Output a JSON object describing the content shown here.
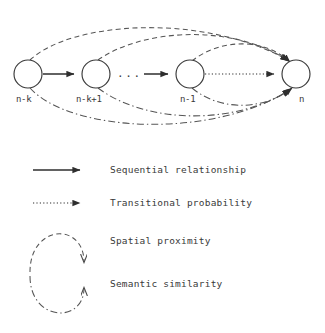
{
  "diagram": {
    "nodes": [
      {
        "id": "n-k",
        "label": "n-k",
        "cx": 28,
        "cy": 74,
        "r": 14
      },
      {
        "id": "n-k+1",
        "label": "n-k+1",
        "cx": 96,
        "cy": 74,
        "r": 14
      },
      {
        "id": "n-1",
        "label": "n-1",
        "cx": 190,
        "cy": 74,
        "r": 14
      },
      {
        "id": "n",
        "label": "n",
        "cx": 296,
        "cy": 74,
        "r": 14
      }
    ],
    "ellipsis": "...",
    "edge_types": {
      "sequential": "solid",
      "transitional": "dotted",
      "spatial": "dashed",
      "semantic": "dashdot"
    },
    "stroke_color": "#3a3a3a",
    "node_fill": "#ffffff"
  },
  "legend": {
    "items": [
      {
        "label": "Sequential relationship",
        "style": "solid",
        "shape": "arrow"
      },
      {
        "label": "Transitional probability",
        "style": "dotted",
        "shape": "arrow"
      },
      {
        "label": "Spatial proximity",
        "style": "dashed",
        "shape": "curve-down"
      },
      {
        "label": "Semantic similarity",
        "style": "dashdot",
        "shape": "curve-up"
      }
    ]
  }
}
